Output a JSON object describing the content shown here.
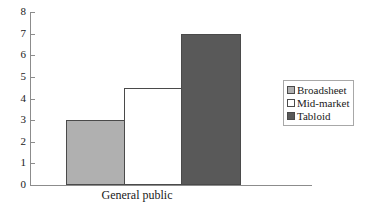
{
  "chart_data": {
    "type": "bar",
    "title": "",
    "subtitle": "",
    "xlabel": "General public",
    "ylabel": "",
    "categories": [
      "General public"
    ],
    "series": [
      {
        "name": "Broadsheet",
        "values": [
          3
        ],
        "color": "#b0b0b0"
      },
      {
        "name": "Mid-market",
        "values": [
          4.5
        ],
        "color": "#ffffff"
      },
      {
        "name": "Tabloid",
        "values": [
          7
        ],
        "color": "#595959"
      }
    ],
    "ylim": [
      0,
      8
    ],
    "ytick_labels": [
      "8",
      "7",
      "6",
      "5",
      "4",
      "3",
      "2",
      "1",
      "0"
    ],
    "ytick_values": [
      8,
      7,
      6,
      5,
      4,
      3,
      2,
      1,
      0
    ],
    "grid": false,
    "legend_position": "right",
    "bar_border_color": "#4a4a4a",
    "axis_color": "#8c8c8c"
  },
  "legend": {
    "entries": [
      {
        "label": "Broadsheet",
        "color": "#b0b0b0"
      },
      {
        "label": "Mid-market",
        "color": "#ffffff"
      },
      {
        "label": "Tabloid",
        "color": "#595959"
      }
    ]
  },
  "axes": {
    "x_label": "General public"
  }
}
